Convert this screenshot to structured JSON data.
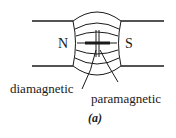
{
  "figure": {
    "poles": {
      "north": "N",
      "south": "S"
    },
    "labels": {
      "diamagnetic": "diamagnetic",
      "paramagnetic": "paramagnetic"
    },
    "caption": "(a)",
    "colors": {
      "line": "#1a1a1a",
      "background": "#ffffff"
    }
  }
}
